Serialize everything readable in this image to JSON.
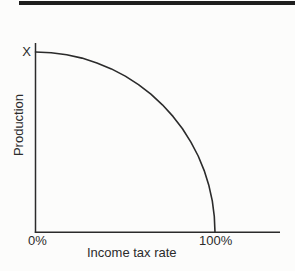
{
  "figure": {
    "y_max_label": "X",
    "y_axis_title": "Production",
    "x_axis_title": "Income tax rate",
    "x_tick_left": "0%",
    "x_tick_right": "100%"
  },
  "colors": {
    "ink": "#2b2b2b",
    "top_rule": "#1e1e1e",
    "background": "#fcfcfb"
  },
  "chart_data": {
    "type": "line",
    "title": "",
    "xlabel": "Income tax rate",
    "ylabel": "Production",
    "x_tick_labels": [
      "0%",
      "100%"
    ],
    "y_axis_point_label": "X",
    "x_unit": "income tax rate (%)",
    "y_unit": "fraction of maximum production X",
    "xlim": [
      0,
      136
    ],
    "ylim": [
      0,
      1.05
    ],
    "grid": false,
    "legend": false,
    "series": [
      {
        "name": "Production",
        "points": [
          [
            0,
            1.0
          ],
          [
            8.72,
            0.9962
          ],
          [
            17.36,
            0.9848
          ],
          [
            25.88,
            0.9659
          ],
          [
            34.2,
            0.9397
          ],
          [
            42.26,
            0.9063
          ],
          [
            50.0,
            0.866
          ],
          [
            57.36,
            0.8192
          ],
          [
            64.28,
            0.766
          ],
          [
            70.71,
            0.7071
          ],
          [
            76.6,
            0.6428
          ],
          [
            81.92,
            0.5736
          ],
          [
            86.6,
            0.5
          ],
          [
            90.63,
            0.4226
          ],
          [
            93.97,
            0.342
          ],
          [
            96.59,
            0.2588
          ],
          [
            98.48,
            0.1736
          ],
          [
            99.62,
            0.0872
          ],
          [
            100.0,
            0.0
          ]
        ]
      }
    ]
  }
}
